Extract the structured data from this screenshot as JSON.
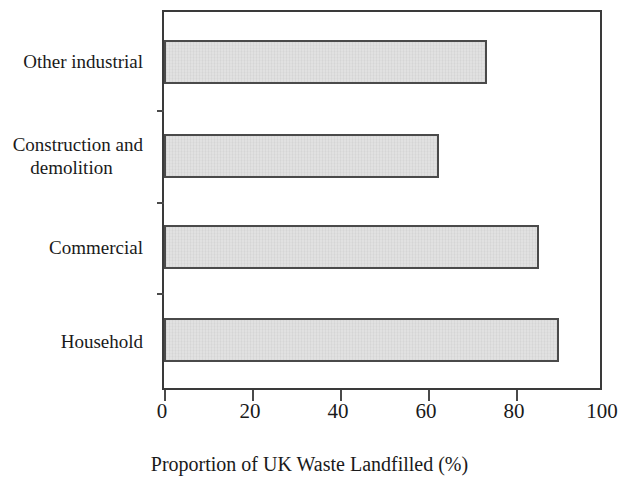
{
  "chart_data": {
    "type": "bar",
    "orientation": "horizontal",
    "title": "",
    "subtitle": "",
    "xlabel": "Proportion of UK Waste Landfilled (%)",
    "ylabel": "",
    "categories": [
      "Household",
      "Commercial",
      "Construction and\ndemolition",
      "Other industrial"
    ],
    "values": [
      90.5,
      86,
      63,
      74
    ],
    "series": [
      {
        "name": "Proportion of UK Waste Landfilled (%)",
        "values": [
          90.5,
          86,
          63,
          74
        ]
      }
    ],
    "xlim": [
      0,
      100
    ],
    "xticks": [
      0,
      20,
      40,
      60,
      80,
      100
    ],
    "xtick_labels": [
      "0",
      "20",
      "40",
      "60",
      "80",
      "100"
    ],
    "grid": false,
    "legend": false,
    "legend_position": "none",
    "bar_fill_color": "#e1e1e1",
    "bar_edge_color": "#4a4a4a",
    "axis_color": "#3a3a3a",
    "background_color": "#ffffff"
  },
  "category_labels": {
    "other_industrial": "Other industrial",
    "construction_line1": "Construction and",
    "construction_line2": "demolition",
    "commercial": "Commercial",
    "household": "Household"
  },
  "axis": {
    "x_title": "Proportion of UK Waste Landfilled (%)",
    "tick_0": "0",
    "tick_20": "20",
    "tick_40": "40",
    "tick_60": "60",
    "tick_80": "80",
    "tick_100": "100"
  }
}
